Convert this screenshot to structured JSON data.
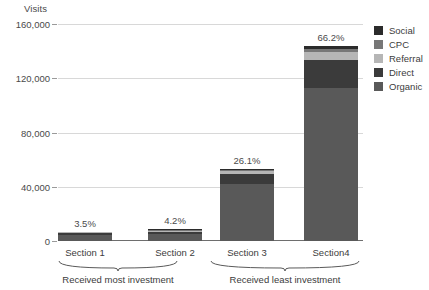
{
  "chart_data": {
    "type": "bar",
    "subtype": "stacked-bar",
    "title": "",
    "ylabel": "Visits",
    "xlabel": "",
    "ylim": [
      0,
      160000
    ],
    "yticks": [
      0,
      40000,
      80000,
      120000,
      160000
    ],
    "ytick_labels": [
      "0",
      "40,000",
      "80,000",
      "120,000",
      "160,000"
    ],
    "grid": true,
    "legend_position": "right",
    "categories": [
      "Section 1",
      "Section 2",
      "Section 3",
      "Section4"
    ],
    "data_labels": [
      "3.5%",
      "4.2%",
      "26.1%",
      "66.2%"
    ],
    "totals": [
      7000,
      8500,
      53000,
      144000
    ],
    "series": [
      {
        "name": "Organic",
        "color": "#595959",
        "values": [
          4300,
          5200,
          42000,
          113000
        ]
      },
      {
        "name": "Direct",
        "color": "#3b3b3b",
        "values": [
          1500,
          1800,
          7200,
          20500
        ]
      },
      {
        "name": "Referral",
        "color": "#b6b6b6",
        "values": [
          600,
          750,
          2100,
          6000
        ]
      },
      {
        "name": "CPC",
        "color": "#777777",
        "values": [
          350,
          450,
          900,
          2200
        ]
      },
      {
        "name": "Social",
        "color": "#2b2b2b",
        "values": [
          250,
          300,
          800,
          2300
        ]
      }
    ],
    "groups": [
      {
        "label": "Received most investment",
        "categories": [
          "Section 1",
          "Section 2"
        ]
      },
      {
        "label": "Received least investment",
        "categories": [
          "Section 3",
          "Section4"
        ]
      }
    ]
  },
  "legend": {
    "items": [
      {
        "label": "Social",
        "color": "#2b2b2b"
      },
      {
        "label": "CPC",
        "color": "#777777"
      },
      {
        "label": "Referral",
        "color": "#b6b6b6"
      },
      {
        "label": "Direct",
        "color": "#3b3b3b"
      },
      {
        "label": "Organic",
        "color": "#595959"
      }
    ]
  },
  "colors": {
    "gridline": "#d8d8d8",
    "axis": "#6e6e6e",
    "text": "#3c3c3c",
    "background": "#ffffff"
  }
}
